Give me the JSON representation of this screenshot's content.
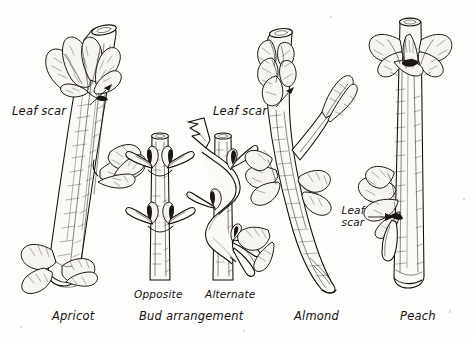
{
  "figure": {
    "background_color": "#fdfdfb",
    "ink_color": "#100d0a",
    "style": "pen-and-ink botanical line drawing"
  },
  "specimens": [
    {
      "id": "apricot",
      "label": "Apricot",
      "label_x": 52,
      "label_y": 310,
      "orientation": "diagonal",
      "bud_clusters": 3,
      "annotation": {
        "text": "Leaf scar",
        "x": 12,
        "y": 105,
        "pointer_from": [
          88,
          108
        ],
        "pointer_to": [
          106,
          90
        ]
      }
    },
    {
      "id": "opposite",
      "label": "Opposite",
      "label_x": 134,
      "label_y": 288,
      "orientation": "vertical",
      "node_count": 2,
      "annotation": null
    },
    {
      "id": "alternate",
      "label": "Alternate",
      "label_x": 205,
      "label_y": 288,
      "orientation": "vertical",
      "node_count": 3,
      "annotation": null
    },
    {
      "id": "almond",
      "label": "Almond",
      "label_x": 294,
      "label_y": 310,
      "orientation": "diagonal",
      "bud_clusters": 5,
      "annotation": {
        "text": "Leaf scar",
        "x": 213,
        "y": 105,
        "pointer_from": [
          274,
          108
        ],
        "pointer_to": [
          281,
          95
        ]
      }
    },
    {
      "id": "peach",
      "label": "Peach",
      "label_x": 400,
      "label_y": 310,
      "orientation": "vertical",
      "bud_clusters": 2,
      "annotation": {
        "text": "Leaf scar",
        "x": 337,
        "y": 208,
        "pointer_from": [
          376,
          219
        ],
        "pointer_to": [
          392,
          219
        ]
      }
    }
  ],
  "group_labels": [
    {
      "id": "bud-arrangement",
      "text": "Bud arrangement",
      "x": 139,
      "y": 310,
      "applies_to": [
        "opposite",
        "alternate"
      ]
    }
  ],
  "annotation_text": {
    "leaf_scar": "Leaf scar",
    "leaf_scar_line1": "Leaf",
    "leaf_scar_line2": "scar"
  }
}
